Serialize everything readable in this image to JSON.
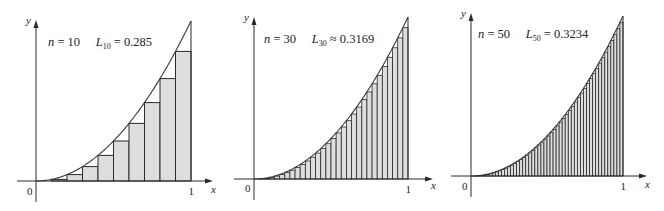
{
  "colors": {
    "background": "#ffffff",
    "rect_fill": "#dedede",
    "stroke": "#2a2a2a",
    "curve": "#3a3a3a"
  },
  "chart_data": [
    {
      "type": "bar",
      "description": "Left-endpoint Riemann sum approximation of y = x^2 on [0,1]",
      "function": "x^2",
      "n": 10,
      "annotation": {
        "n_label": "n",
        "n_value": "10",
        "L_label": "L",
        "L_sub": "10",
        "relation": "=",
        "L_value": "0.285"
      },
      "x_axis_label": "x",
      "y_axis_label": "y",
      "x_ticks": [
        "0",
        "1"
      ],
      "xlim": [
        0,
        1
      ],
      "ylim": [
        0,
        1
      ],
      "rect_left_endpoints": [
        0,
        0.1,
        0.2,
        0.3,
        0.4,
        0.5,
        0.6,
        0.7,
        0.8,
        0.9
      ],
      "rect_heights": [
        0,
        0.01,
        0.04,
        0.09,
        0.16,
        0.25,
        0.36,
        0.49,
        0.64,
        0.81
      ],
      "layout": {
        "origin_x": 36,
        "origin_y": 181,
        "unit_x": 155,
        "unit_y": 160,
        "axis_left": 17,
        "axis_right": 213,
        "y_axis_top": 20,
        "y_axis_bottom": 202,
        "text_x": 48,
        "text_y": 46,
        "y_label_x": 26,
        "y_label_y": 24,
        "zero_x": 27,
        "zero_y": 195,
        "one_y": 195,
        "x_label_dx": 22,
        "x_label_y": 193
      }
    },
    {
      "type": "bar",
      "description": "Left-endpoint Riemann sum approximation of y = x^2 on [0,1]",
      "function": "x^2",
      "n": 30,
      "annotation": {
        "n_label": "n",
        "n_value": "30",
        "L_label": "L",
        "L_sub": "30",
        "relation": "≈",
        "L_value": "0.3169"
      },
      "x_axis_label": "x",
      "y_axis_label": "y",
      "x_ticks": [
        "0",
        "1"
      ],
      "xlim": [
        0,
        1
      ],
      "ylim": [
        0,
        1
      ],
      "layout": {
        "origin_x": 254,
        "origin_y": 179,
        "unit_x": 154,
        "unit_y": 162,
        "axis_left": 234,
        "axis_right": 433,
        "y_axis_top": 17,
        "y_axis_bottom": 200,
        "text_x": 264,
        "text_y": 43,
        "y_label_x": 244,
        "y_label_y": 21,
        "zero_x": 245,
        "zero_y": 192,
        "one_y": 193,
        "x_label_dx": 21,
        "x_label_y": 189
      }
    },
    {
      "type": "bar",
      "description": "Left-endpoint Riemann sum approximation of y = x^2 on [0,1]",
      "function": "x^2",
      "n": 50,
      "annotation": {
        "n_label": "n",
        "n_value": "50",
        "L_label": "L",
        "L_sub": "50",
        "relation": "=",
        "L_value": "0.3234"
      },
      "x_axis_label": "x",
      "y_axis_label": "y",
      "x_ticks": [
        "0",
        "1"
      ],
      "xlim": [
        0,
        1
      ],
      "ylim": [
        0,
        1
      ],
      "layout": {
        "origin_x": 471,
        "origin_y": 176,
        "unit_x": 152,
        "unit_y": 160,
        "axis_left": 451,
        "axis_right": 647,
        "y_axis_top": 13,
        "y_axis_bottom": 197,
        "text_x": 478,
        "text_y": 38,
        "y_label_x": 461,
        "y_label_y": 17,
        "zero_x": 462,
        "zero_y": 190,
        "one_y": 190,
        "x_label_dx": 20,
        "x_label_y": 188
      }
    }
  ]
}
